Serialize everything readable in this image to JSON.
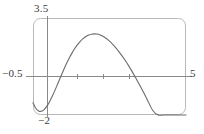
{
  "figure": {
    "name": "graphing-calculator-plot",
    "frame": {
      "stroke": "#b9b9b9",
      "corner_radius": 7,
      "x": 33,
      "y": 18,
      "width": 153,
      "height": 97
    },
    "colors": {
      "curve": "#6b6b6b",
      "axis": "#8a8a8a",
      "frame": "#b9b9b9",
      "text": "#3a3a3a",
      "background": "#ffffff"
    },
    "labels": {
      "y_max": "3.5",
      "y_min": "−2",
      "x_min": "−0.5",
      "x_max": "5"
    }
  },
  "chart_data": {
    "type": "line",
    "title": "",
    "xlabel": "",
    "ylabel": "",
    "xlim": [
      -0.5,
      5
    ],
    "ylim": [
      -2,
      3.5
    ],
    "grid": false,
    "legend": false,
    "axes": {
      "x_axis_at_y": 0,
      "y_axis_at_x": 0,
      "x_ticks": [
        1,
        2,
        3
      ],
      "x_tick_labels": [
        "",
        "",
        ""
      ],
      "y_ticks": [],
      "y_tick_labels": []
    },
    "annotations": [
      {
        "text": "3.5",
        "role": "y-axis-max-label",
        "position": "top-left-of-frame"
      },
      {
        "text": "−2",
        "role": "y-axis-min-label",
        "position": "bottom-left-of-frame"
      },
      {
        "text": "−0.5",
        "role": "x-axis-min-label",
        "position": "left-of-frame-on-axis"
      },
      {
        "text": "5",
        "role": "x-axis-max-label",
        "position": "right-of-frame-on-axis"
      }
    ],
    "series": [
      {
        "name": "curve",
        "x": [
          -0.5,
          -0.4,
          -0.3,
          -0.2,
          -0.1,
          0.0,
          0.1,
          0.2,
          0.3,
          0.4,
          0.5,
          0.6,
          0.7,
          0.8,
          0.9,
          1.0,
          1.1,
          1.2,
          1.3,
          1.4,
          1.5,
          1.6,
          1.7,
          1.8,
          1.9,
          2.0,
          2.2,
          2.4,
          2.6,
          2.8,
          3.0,
          3.2,
          3.4,
          3.6,
          3.8,
          4.0,
          4.2,
          4.4,
          4.6,
          4.8,
          5.0
        ],
        "y": [
          -1.3,
          -1.62,
          -1.77,
          -1.79,
          -1.69,
          -1.5,
          -1.23,
          -0.91,
          -0.56,
          -0.19,
          0.18,
          0.55,
          0.9,
          1.22,
          1.51,
          1.77,
          1.99,
          2.18,
          2.33,
          2.45,
          2.53,
          2.58,
          2.6,
          2.59,
          2.55,
          2.48,
          2.26,
          1.95,
          1.57,
          1.13,
          0.63,
          0.08,
          -0.5,
          -1.1,
          -1.73,
          -2.0,
          -2.0,
          -2.0,
          -2.0,
          -2.0,
          -2.0
        ]
      }
    ]
  }
}
